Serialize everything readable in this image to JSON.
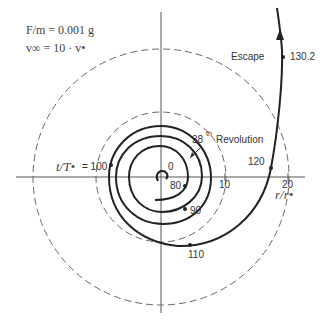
{
  "parameters": {
    "line1": "F/m = 0.001 g",
    "line2": "v∞ = 10 · v•"
  },
  "axes": {
    "x_label": "r/r•",
    "y_label": "t/T•",
    "ticks": [
      "10",
      "20"
    ]
  },
  "annotations": {
    "escape": "Escape",
    "revolution_sup": "th",
    "revolution_num": "38",
    "revolution_word": "Revolution"
  },
  "time_markers": [
    {
      "label": "0"
    },
    {
      "label": "80"
    },
    {
      "label": "90"
    },
    {
      "label": "= 100"
    },
    {
      "label": "110"
    },
    {
      "label": "120"
    },
    {
      "label": "130.2"
    }
  ],
  "colors": {
    "curve": "#222222",
    "axis": "#555555",
    "dashed": "#666666"
  }
}
